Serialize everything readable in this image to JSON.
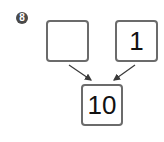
{
  "problem": {
    "number": "8",
    "boxes": {
      "top_left": "",
      "top_right": "1",
      "bottom": "10"
    }
  },
  "colors": {
    "box_border": "#6b6b6b",
    "badge_bg": "#4a4a4a",
    "arrow": "#3a3a3a"
  }
}
